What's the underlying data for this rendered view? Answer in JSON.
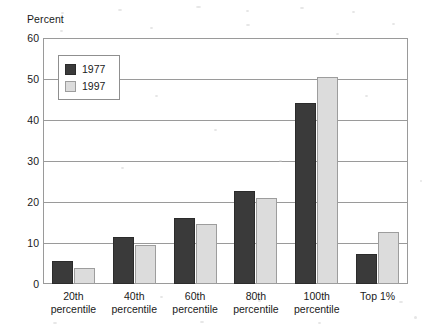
{
  "chart_data": {
    "type": "bar",
    "title": "",
    "subtitle": "",
    "xlabel": "",
    "ylabel": "Percent",
    "ylim": [
      0,
      60
    ],
    "ytick_labels": [
      "0",
      "10",
      "20",
      "30",
      "40",
      "50",
      "60"
    ],
    "ytick_values": [
      0,
      10,
      20,
      30,
      40,
      50,
      60
    ],
    "grid": true,
    "grid_axis": "y",
    "legend_position": "upper-left-inside",
    "categories": [
      "20th percentile",
      "40th percentile",
      "60th percentile",
      "80th percentile",
      "100th percentile",
      "Top 1%"
    ],
    "category_lines": [
      [
        "20th",
        "percentile"
      ],
      [
        "40th",
        "percentile"
      ],
      [
        "60th",
        "percentile"
      ],
      [
        "80th",
        "percentile"
      ],
      [
        "100th",
        "percentile"
      ],
      [
        "Top 1%",
        ""
      ]
    ],
    "series": [
      {
        "name": "1977",
        "color": "#3a3a3a",
        "values": [
          5.7,
          11.4,
          16.2,
          22.7,
          44.2,
          7.2
        ]
      },
      {
        "name": "1997",
        "color": "#dcdcdc",
        "values": [
          4.0,
          9.5,
          14.6,
          21.0,
          50.4,
          12.7
        ]
      }
    ]
  },
  "legend": {
    "items": [
      {
        "label": "1977",
        "color": "#3a3a3a"
      },
      {
        "label": "1997",
        "color": "#dcdcdc"
      }
    ]
  },
  "axes": {
    "y_title": "Percent",
    "frame_color": "#9a9a9a"
  }
}
